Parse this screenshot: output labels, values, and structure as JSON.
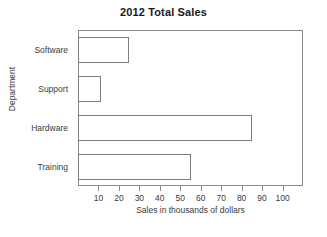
{
  "chart_data": {
    "type": "bar",
    "orientation": "horizontal",
    "title": "2012 Total Sales",
    "xlabel": "Sales in thousands of dollars",
    "ylabel": "Department",
    "categories": [
      "Software",
      "Support",
      "Hardware",
      "Training"
    ],
    "values": [
      25,
      11,
      85,
      55
    ],
    "series": [
      {
        "name": "2012 Total Sales",
        "values": [
          25,
          11,
          85,
          55
        ]
      }
    ],
    "xlim": [
      0,
      110
    ],
    "xticks": [
      10,
      20,
      30,
      40,
      50,
      60,
      70,
      80,
      90,
      100
    ],
    "xtick_labels": [
      "10",
      "20",
      "30",
      "40",
      "50",
      "60",
      "70",
      "80",
      "90",
      "100"
    ],
    "grid": false,
    "legend": false,
    "bar_fill_color": "#ffffff",
    "bar_edge_color": "#7d7d7d",
    "axis_color": "#8a8a8a",
    "text_color": "#3a3a3a",
    "title_color": "#1a1a1a"
  }
}
